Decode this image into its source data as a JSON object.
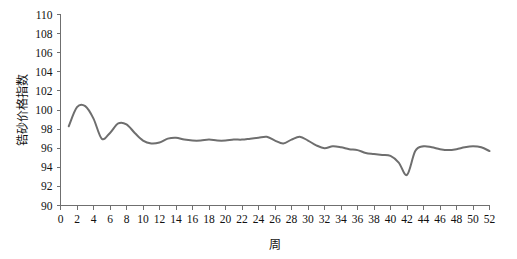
{
  "chart_data": {
    "type": "line",
    "title": "",
    "xlabel": "周",
    "ylabel": "锆砂价格指数",
    "xlim": [
      0,
      52
    ],
    "ylim": [
      90,
      110
    ],
    "grid": false,
    "legend": null,
    "line_color": "#6e6e6e",
    "axis_color": "#6f6f6f",
    "xticks": [
      0,
      2,
      4,
      6,
      8,
      10,
      12,
      14,
      16,
      18,
      20,
      22,
      24,
      26,
      28,
      30,
      32,
      34,
      36,
      38,
      40,
      42,
      44,
      46,
      48,
      50,
      52
    ],
    "xtick_labels": [
      "0",
      "2",
      "4",
      "6",
      "8",
      "10",
      "12",
      "14",
      "16",
      "18",
      "20",
      "22",
      "24",
      "26",
      "28",
      "30",
      "32",
      "34",
      "36",
      "38",
      "40",
      "42",
      "44",
      "46",
      "48",
      "50",
      "52"
    ],
    "yticks": [
      90,
      92,
      94,
      96,
      98,
      100,
      102,
      104,
      106,
      108,
      110
    ],
    "ytick_labels": [
      "90",
      "92",
      "94",
      "96",
      "98",
      "100",
      "102",
      "104",
      "106",
      "108",
      "110"
    ],
    "x": [
      1,
      2,
      3,
      4,
      5,
      6,
      7,
      8,
      9,
      10,
      11,
      12,
      13,
      14,
      15,
      16,
      17,
      18,
      19,
      20,
      21,
      22,
      23,
      24,
      25,
      26,
      27,
      28,
      29,
      30,
      31,
      32,
      33,
      34,
      35,
      36,
      37,
      38,
      39,
      40,
      41,
      42,
      43,
      44,
      45,
      46,
      47,
      48,
      49,
      50,
      51,
      52
    ],
    "values": [
      98.3,
      100.3,
      100.4,
      99.1,
      97.0,
      97.6,
      98.6,
      98.5,
      97.6,
      96.8,
      96.5,
      96.6,
      97.0,
      97.1,
      96.9,
      96.8,
      96.8,
      96.9,
      96.8,
      96.8,
      96.9,
      96.9,
      97.0,
      97.1,
      97.2,
      96.8,
      96.5,
      96.9,
      97.2,
      96.8,
      96.3,
      96.0,
      96.2,
      96.1,
      95.9,
      95.8,
      95.5,
      95.4,
      95.3,
      95.2,
      94.5,
      93.2,
      95.7,
      96.2,
      96.1,
      95.9,
      95.8,
      95.9,
      96.1,
      96.2,
      96.1,
      95.7
    ]
  }
}
